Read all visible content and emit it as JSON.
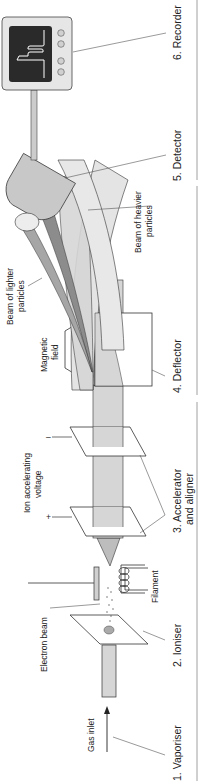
{
  "diagram": {
    "orientation": "rotated-90-ccw",
    "colors": {
      "beam_light": "#d6d6d6",
      "beam_mid": "#b4b4b4",
      "beam_dark": "#8c8c8c",
      "plate": "#ffffff",
      "screen": "#2a2a2a",
      "trace": "#ffffff",
      "recorder_body": "#e6e6e6",
      "detector": "#c8c8c8",
      "divider": "#888888"
    },
    "stages": [
      {
        "id": "vaporiser",
        "label": "1. Vaporiser"
      },
      {
        "id": "ioniser",
        "label": "2. Ioniser"
      },
      {
        "id": "accelerator",
        "label": "3. Accelerator",
        "label2": "and aligner"
      },
      {
        "id": "deflector",
        "label": "4. Deflector"
      },
      {
        "id": "detector",
        "label": "5. Detector"
      },
      {
        "id": "recorder",
        "label": "6. Recorder"
      }
    ],
    "annotations": {
      "gas_inlet": "Gas inlet",
      "electron_beam": "Electron beam",
      "filament": "Filament",
      "ion_voltage_1": "Ion accelerating",
      "ion_voltage_2": "voltage",
      "plus": "+",
      "minus": "–",
      "magnetic_1": "Magnetic",
      "magnetic_2": "field",
      "lighter_1": "Beam of lighter",
      "lighter_2": "particles",
      "heavier_1": "Beam of heavier",
      "heavier_2": "particles"
    }
  }
}
